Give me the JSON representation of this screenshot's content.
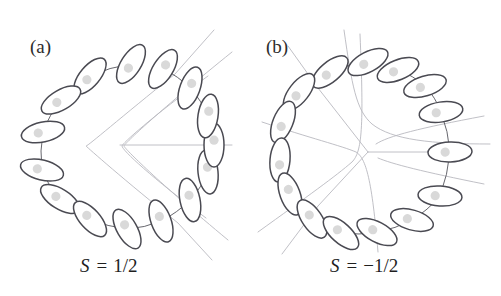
{
  "figure": {
    "background": "#ffffff",
    "width": 501,
    "height": 296
  },
  "style": {
    "ellipse_stroke": "#4a4a52",
    "ellipse_fill": "#ffffff",
    "dot_fill": "#d9d9d9",
    "connector_stroke": "#55555c",
    "fieldline_stroke": "#b9b9bf",
    "label_color": "#2d2d2d",
    "caption_color": "#1f1f1f"
  },
  "panels": [
    {
      "id": "a",
      "label": "(a)",
      "label_x": 30,
      "label_y": 53,
      "caption": "S = 1/2",
      "caption_symbol": "S",
      "caption_equals": "=",
      "caption_value": "1/2",
      "caption_x": 80,
      "caption_y": 272,
      "winding_number": 0.5,
      "center_x": 128,
      "center_y": 145,
      "molecule_count": 15,
      "molecules": [
        {
          "cx": 131,
          "cy": 64,
          "angle": -58,
          "rx": 22,
          "ry": 10
        },
        {
          "cx": 90,
          "cy": 76,
          "angle": -50,
          "rx": 22,
          "ry": 10
        },
        {
          "cx": 61,
          "cy": 100,
          "angle": -30,
          "rx": 22,
          "ry": 10
        },
        {
          "cx": 43,
          "cy": 132,
          "angle": -12,
          "rx": 22,
          "ry": 10
        },
        {
          "cx": 42,
          "cy": 170,
          "angle": 14,
          "rx": 22,
          "ry": 10
        },
        {
          "cx": 60,
          "cy": 199,
          "angle": 32,
          "rx": 22,
          "ry": 10
        },
        {
          "cx": 90,
          "cy": 219,
          "angle": 48,
          "rx": 22,
          "ry": 10
        },
        {
          "cx": 127,
          "cy": 229,
          "angle": 60,
          "rx": 22,
          "ry": 10
        },
        {
          "cx": 161,
          "cy": 221,
          "angle": 70,
          "rx": 22,
          "ry": 10
        },
        {
          "cx": 190,
          "cy": 200,
          "angle": 78,
          "rx": 22,
          "ry": 10
        },
        {
          "cx": 208,
          "cy": 172,
          "angle": 84,
          "rx": 22,
          "ry": 10
        },
        {
          "cx": 214,
          "cy": 145,
          "angle": 90,
          "rx": 22,
          "ry": 10
        },
        {
          "cx": 208,
          "cy": 116,
          "angle": 99,
          "rx": 22,
          "ry": 10
        },
        {
          "cx": 190,
          "cy": 88,
          "angle": 110,
          "rx": 22,
          "ry": 10
        },
        {
          "cx": 163,
          "cy": 69,
          "angle": 122,
          "rx": 22,
          "ry": 10
        }
      ],
      "field_lines": [
        "M 214 30 L 175 74 C 120 118 88 146 86 146 C 88 148 124 180 178 223 L 212 260",
        "M 232 52 C 160 110 124 144 124 146 C 124 148 158 182 228 240",
        "M 208 76 C 150 118 122 144 122 146 C 122 150 152 178 206 218",
        "M 120 145 L 232 145"
      ]
    },
    {
      "id": "b",
      "label": "(b)",
      "label_x": 266,
      "label_y": 53,
      "caption": "S = -1/2",
      "caption_symbol": "S",
      "caption_equals": "=",
      "caption_value": "−1/2",
      "caption_x": 330,
      "caption_y": 272,
      "winding_number": -0.5,
      "center_x": 368,
      "center_y": 150,
      "molecule_count": 15,
      "molecules": [
        {
          "cx": 368,
          "cy": 62,
          "angle": -28,
          "rx": 22,
          "ry": 10
        },
        {
          "cx": 330,
          "cy": 72,
          "angle": -40,
          "rx": 22,
          "ry": 10
        },
        {
          "cx": 299,
          "cy": 92,
          "angle": -52,
          "rx": 22,
          "ry": 10
        },
        {
          "cx": 283,
          "cy": 122,
          "angle": -68,
          "rx": 22,
          "ry": 10
        },
        {
          "cx": 280,
          "cy": 160,
          "angle": -85,
          "rx": 22,
          "ry": 10
        },
        {
          "cx": 290,
          "cy": 194,
          "angle": 70,
          "rx": 22,
          "ry": 10
        },
        {
          "cx": 312,
          "cy": 219,
          "angle": 56,
          "rx": 22,
          "ry": 10
        },
        {
          "cx": 341,
          "cy": 233,
          "angle": 42,
          "rx": 22,
          "ry": 10
        },
        {
          "cx": 377,
          "cy": 232,
          "angle": 28,
          "rx": 22,
          "ry": 10
        },
        {
          "cx": 412,
          "cy": 220,
          "angle": 16,
          "rx": 22,
          "ry": 10
        },
        {
          "cx": 440,
          "cy": 196,
          "angle": 4,
          "rx": 22,
          "ry": 10
        },
        {
          "cx": 450,
          "cy": 152,
          "angle": -2,
          "rx": 22,
          "ry": 10
        },
        {
          "cx": 441,
          "cy": 112,
          "angle": -9,
          "rx": 22,
          "ry": 10
        },
        {
          "cx": 425,
          "cy": 86,
          "angle": -17,
          "rx": 22,
          "ry": 10
        },
        {
          "cx": 398,
          "cy": 70,
          "angle": -22,
          "rx": 22,
          "ry": 10
        }
      ],
      "field_lines": [
        "M 368 152 L 318 88 L 288 46",
        "M 368 152 L 318 206 L 282 254",
        "M 368 152 L 468 152",
        "M 344 30 C 352 86 356 110 372 124 C 392 140 432 144 490 144",
        "M 258 232 C 308 196 336 176 352 162 C 362 152 364 128 360 34",
        "M 262 122 C 310 138 342 146 356 152 C 366 158 372 180 378 252",
        "M 484 116 C 420 128 388 136 376 144",
        "M 484 184 C 424 172 392 164 378 158"
      ]
    }
  ]
}
